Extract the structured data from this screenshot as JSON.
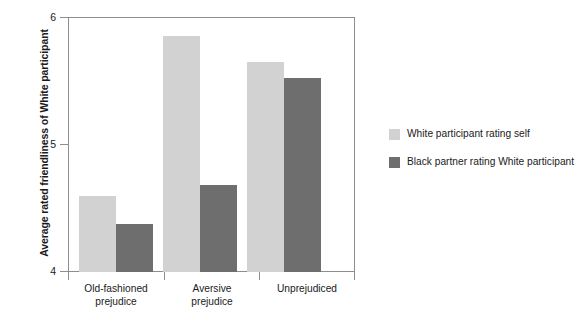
{
  "chart_data": {
    "type": "bar",
    "title": "",
    "xlabel": "",
    "ylabel": "Average rated friendliness of White participant",
    "ylim": [
      4,
      6
    ],
    "yticks": [
      "4",
      "5",
      "6"
    ],
    "ytick_values": [
      4,
      5,
      6
    ],
    "grid": false,
    "legend_position": "right",
    "categories": [
      "Old-fashioned\nprejudice",
      "Aversive\nprejudice",
      "Unprejudiced"
    ],
    "category_lines": [
      [
        "Old-fashioned",
        "prejudice"
      ],
      [
        "Aversive",
        "prejudice"
      ],
      [
        "Unprejudiced"
      ]
    ],
    "series": [
      {
        "name": "White participant rating self",
        "color": "#d2d2d2",
        "values": [
          4.6,
          5.85,
          5.65
        ]
      },
      {
        "name": "Black partner rating White participant",
        "color": "#6e6e6e",
        "values": [
          4.38,
          4.68,
          5.52
        ]
      }
    ]
  },
  "axis": {
    "y_title": "Average rated friendliness of White participant",
    "y_tick_labels": [
      "6",
      "5",
      "4"
    ]
  },
  "legend": {
    "items": [
      {
        "label": "White participant rating self",
        "color": "#d2d2d2"
      },
      {
        "label": "Black partner rating White participant",
        "color": "#6e6e6e"
      }
    ]
  },
  "colors": {
    "light_bar": "#d2d2d2",
    "dark_bar": "#6e6e6e",
    "axis": "#8d8d8d",
    "text": "#1a1a1a",
    "background": "#ffffff"
  }
}
